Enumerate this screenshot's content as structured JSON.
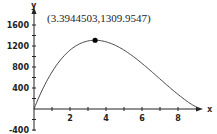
{
  "chart_data": {
    "type": "line",
    "title": "",
    "xlabel": "x",
    "ylabel": "y",
    "xlim": [
      0,
      9.2
    ],
    "ylim": [
      -400,
      1700
    ],
    "grid": false,
    "x_ticks": [
      "2",
      "4",
      "6",
      "8"
    ],
    "x_tick_values": [
      2,
      4,
      6,
      8
    ],
    "y_ticks": [
      "1600",
      "1200",
      "800",
      "400",
      "-400"
    ],
    "y_tick_values": [
      1600,
      1200,
      800,
      400,
      -400
    ],
    "series": [
      {
        "name": "y(x)",
        "x": [
          0,
          0.5,
          1,
          1.5,
          2,
          2.5,
          3,
          3.394,
          4,
          4.5,
          5,
          5.5,
          6,
          6.5,
          7,
          7.5,
          8,
          8.5,
          9,
          9.2
        ],
        "values": [
          0,
          418,
          776,
          1030,
          1225,
          1297,
          1309,
          1310,
          1262,
          1192,
          1086,
          951,
          792,
          618,
          438,
          259,
          93,
          -41,
          -4,
          0
        ]
      }
    ],
    "annotations": [
      {
        "text": "(3.3944503,1309.9547)",
        "x": 3.3944503,
        "y": 1309.9547,
        "marker": "dot"
      }
    ]
  }
}
